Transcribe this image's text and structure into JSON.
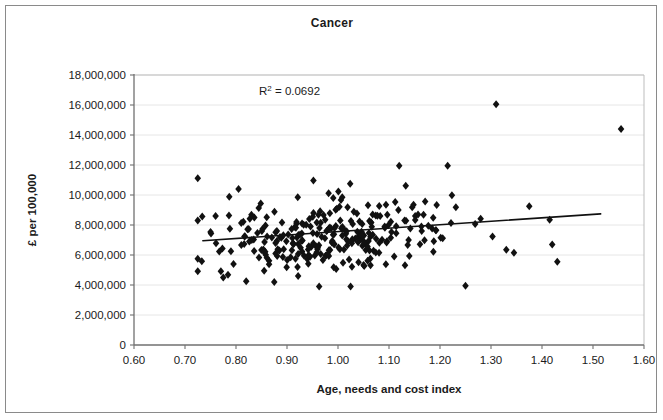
{
  "chart_data": {
    "type": "scatter",
    "title": "Cancer",
    "xlabel": "Age, needs and cost index",
    "ylabel": "£ per 100,000",
    "xlim": [
      0.6,
      1.6
    ],
    "ylim": [
      0,
      18000000
    ],
    "xticks": [
      0.6,
      0.7,
      0.8,
      0.9,
      1.0,
      1.1,
      1.2,
      1.3,
      1.4,
      1.5,
      1.6
    ],
    "xtick_labels": [
      "0.60",
      "0.70",
      "0.80",
      "0.90",
      "1.00",
      "1.10",
      "1.20",
      "1.30",
      "1.40",
      "1.50",
      "1.60"
    ],
    "yticks": [
      0,
      2000000,
      4000000,
      6000000,
      8000000,
      10000000,
      12000000,
      14000000,
      16000000,
      18000000
    ],
    "ytick_labels": [
      "0",
      "2,000,000",
      "4,000,000",
      "6,000,000",
      "8,000,000",
      "10,000,000",
      "12,000,000",
      "14,000,000",
      "16,000,000",
      "18,000,000"
    ],
    "grid": "horizontal",
    "legend": "none",
    "marker": "diamond",
    "marker_color": "#111111",
    "marker_size": 4,
    "annotations": [
      {
        "name": "r-squared",
        "text": "R2 = 0.0692",
        "text_base": "R",
        "text_sup": "2",
        "text_rest": " = 0.0692",
        "x": 0.905,
        "y": 16650000
      }
    ],
    "trendline": {
      "type": "linear",
      "r_squared": 0.0692,
      "x_start": 0.735,
      "y_start": 6950000,
      "x_end": 1.515,
      "y_end": 8740000,
      "color": "#111111",
      "width": 1.6
    },
    "n_points": 303,
    "cluster": {
      "x_mean": 0.985,
      "x_sd": 0.115,
      "x_min": 0.725,
      "x_max": 1.435,
      "y_intercept": 5060000,
      "y_slope": 2290000,
      "y_sd": 1450000,
      "y_min": 3900000,
      "y_max": 12300000,
      "seed": 20250411
    },
    "outliers": [
      {
        "x": 1.31,
        "y": 16050000
      },
      {
        "x": 1.555,
        "y": 14400000
      },
      {
        "x": 1.25,
        "y": 3950000
      },
      {
        "x": 1.375,
        "y": 9250000
      },
      {
        "x": 1.415,
        "y": 8350000
      },
      {
        "x": 1.42,
        "y": 6700000
      },
      {
        "x": 1.43,
        "y": 5550000
      },
      {
        "x": 1.33,
        "y": 6350000
      },
      {
        "x": 1.345,
        "y": 6150000
      },
      {
        "x": 1.215,
        "y": 11950000
      },
      {
        "x": 1.12,
        "y": 11950000
      },
      {
        "x": 0.805,
        "y": 10400000
      },
      {
        "x": 0.76,
        "y": 8600000
      },
      {
        "x": 0.775,
        "y": 4500000
      },
      {
        "x": 0.82,
        "y": 4250000
      },
      {
        "x": 0.875,
        "y": 4200000
      }
    ]
  }
}
